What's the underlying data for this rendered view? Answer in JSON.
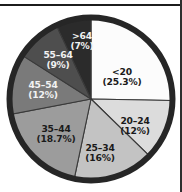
{
  "figure": {
    "background_color": "#ffffff",
    "outline_color": "#262626",
    "rules": {
      "top_rule_color": "#1c1c1c",
      "right_rule_color": "#2e2e2e"
    }
  },
  "chart_data": {
    "type": "pie",
    "title": "",
    "subtitle": "",
    "xlabel": "",
    "ylabel": "",
    "legend_position": "none",
    "grid": false,
    "labels_inside_slices": true,
    "start_angle_deg": 0,
    "direction": "clockwise",
    "total_percent": 100,
    "categories": [
      "<20",
      "20-24",
      "25-34",
      "35-44",
      "45-54",
      "55-64",
      ">64"
    ],
    "values": [
      25.3,
      12,
      16,
      18.7,
      12,
      9,
      7
    ],
    "slices": [
      {
        "name": "<20",
        "name_display": "<20",
        "value": 25.3,
        "value_display": "(25.3%)",
        "color": "#fcfcfc",
        "text_color": "#1a1a1a",
        "text_tone": "on-light"
      },
      {
        "name": "20-24",
        "name_display": "20–24",
        "value": 12,
        "value_display": "(12%)",
        "color": "#dcdcdc",
        "text_color": "#1a1a1a",
        "text_tone": "on-light"
      },
      {
        "name": "25-34",
        "name_display": "25–34",
        "value": 16,
        "value_display": "(16%)",
        "color": "#c3c3c3",
        "text_color": "#1a1a1a",
        "text_tone": "on-light"
      },
      {
        "name": "35-44",
        "name_display": "35–44",
        "value": 18.7,
        "value_display": "(18.7%)",
        "color": "#9c9c9c",
        "text_color": "#1a1a1a",
        "text_tone": "on-light"
      },
      {
        "name": "45-54",
        "name_display": "45–54",
        "value": 12,
        "value_display": "(12%)",
        "color": "#7a7a7a",
        "text_color": "#f2f2f2",
        "text_tone": "on-dark"
      },
      {
        "name": "55-64",
        "name_display": "55–64",
        "value": 9,
        "value_display": "(9%)",
        "color": "#4e4e4e",
        "text_color": "#f2f2f2",
        "text_tone": "on-dark"
      },
      {
        "name": ">64",
        "name_display": ">64",
        "value": 7,
        "value_display": "(7%)",
        "color": "#2b2b2b",
        "text_color": "#f2f2f2",
        "text_tone": "on-dark"
      }
    ]
  }
}
